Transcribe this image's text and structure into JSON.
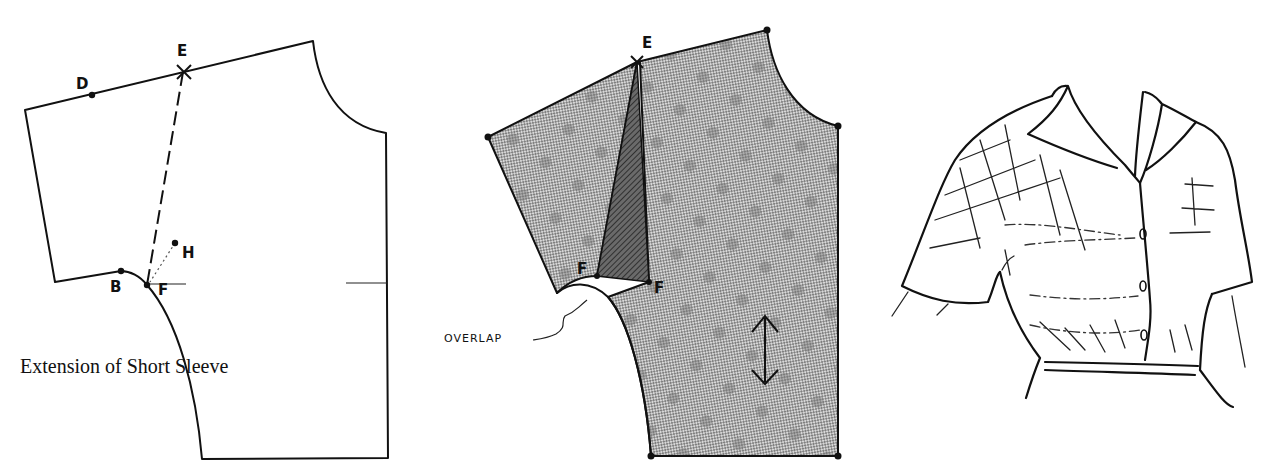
{
  "figure": {
    "panels": [
      {
        "id": "draft",
        "points": [
          "D",
          "E",
          "B",
          "F",
          "H"
        ],
        "caption": "Extension of Short Sleeve"
      },
      {
        "id": "pattern",
        "points": [
          "E",
          "F",
          "F"
        ],
        "annotation": "OVERLAP",
        "grainline": "double-arrow"
      },
      {
        "id": "illustration",
        "subject": "short-sleeve blouse with collar, buttons and gathered waist"
      }
    ],
    "labels": {
      "d": "D",
      "e": "E",
      "b": "B",
      "f": "F",
      "h": "H",
      "e2": "E",
      "f2a": "F",
      "f2b": "F",
      "overlap": "OVERLAP"
    },
    "caption": "Extension of Short Sleeve",
    "colors": {
      "ink": "#111111",
      "fabric_fill": "#bdbdbd",
      "overlap_fill": "#5a5a5a",
      "background": "#ffffff"
    }
  }
}
